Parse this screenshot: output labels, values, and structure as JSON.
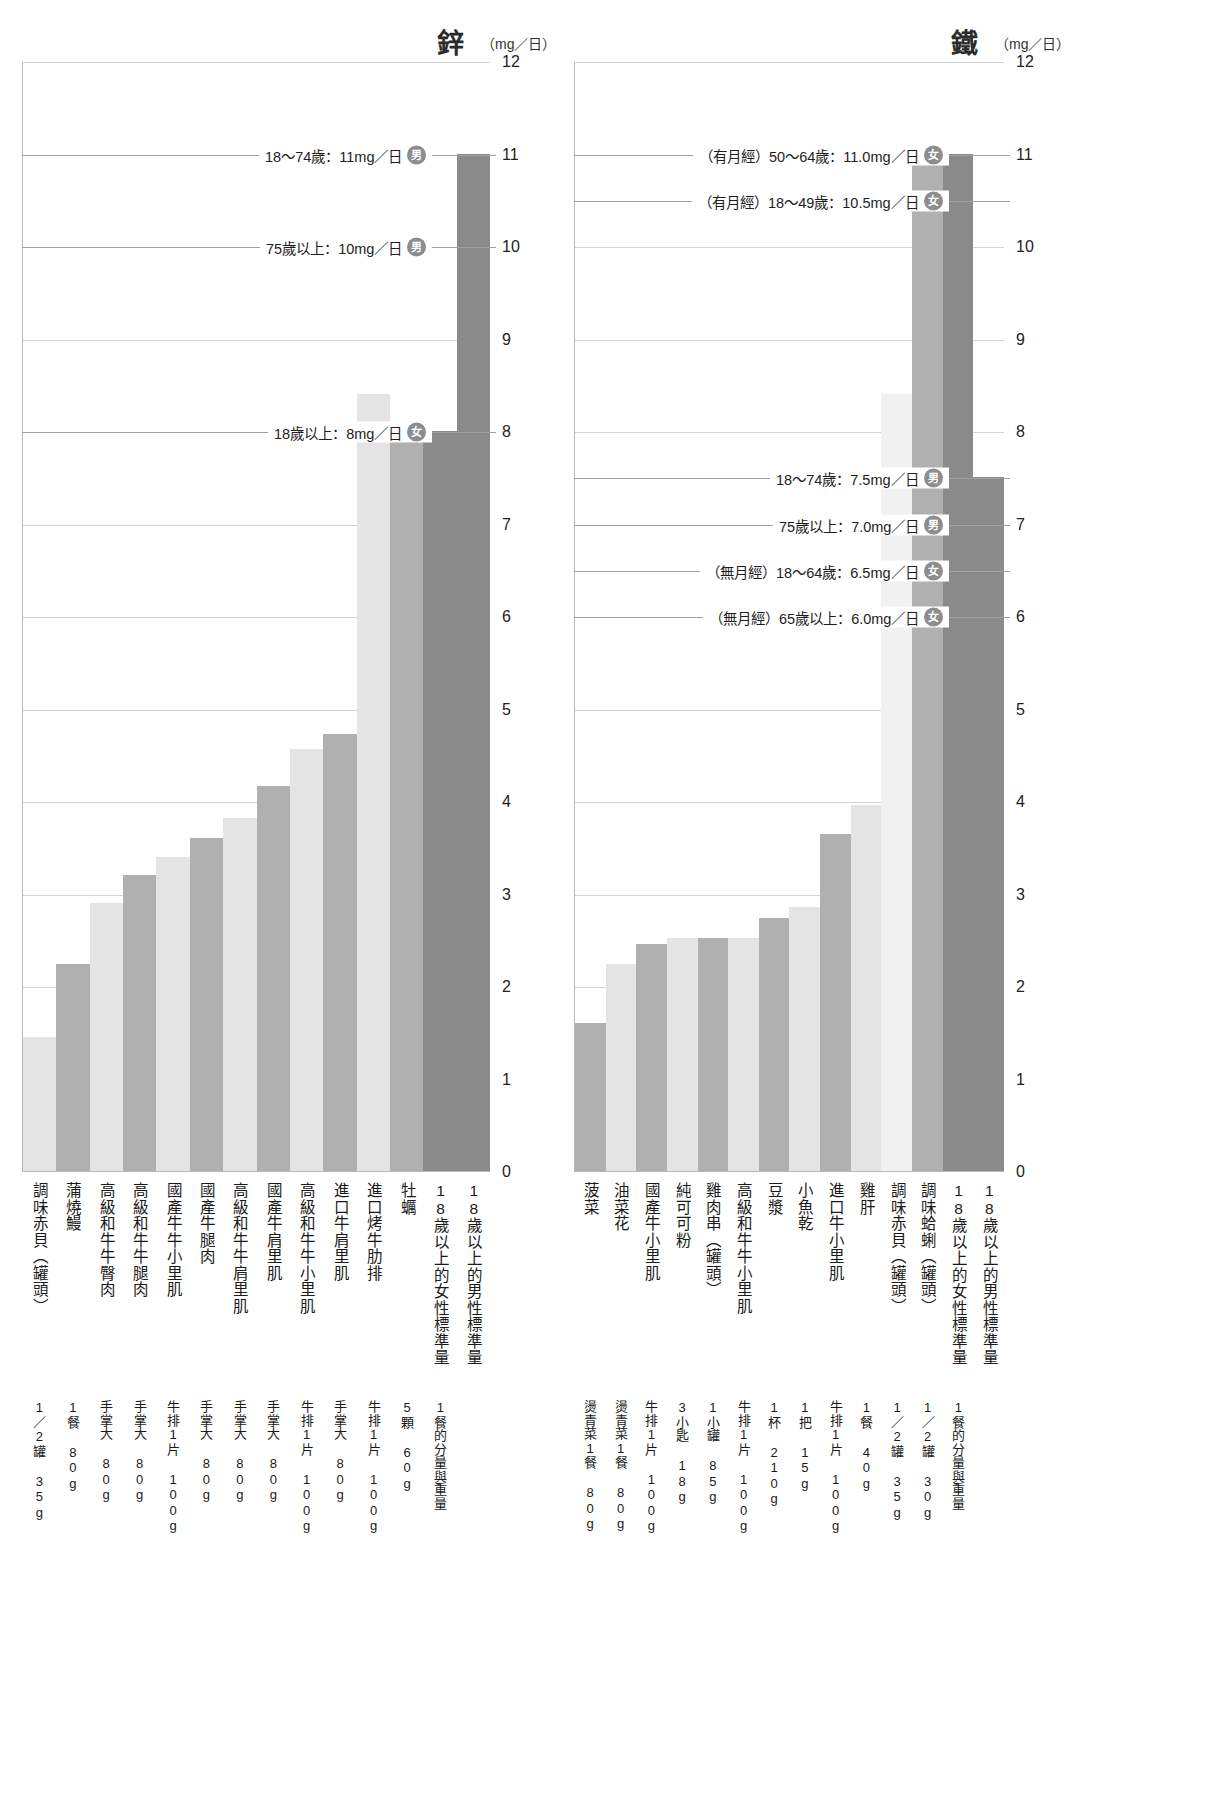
{
  "footnote": "",
  "badges": {
    "male": "男",
    "female": "女"
  },
  "axis": {
    "ticks": [
      "0",
      "1",
      "2",
      "3",
      "4",
      "5",
      "6",
      "7",
      "8",
      "9",
      "10",
      "11",
      "12"
    ],
    "min": 0,
    "max": 12
  },
  "panels": [
    {
      "id": "zinc",
      "title": "鋅",
      "unit": "（mg／日）",
      "references": [
        {
          "label": "18〜74歲：11mg／日",
          "badge": "男",
          "value": 11
        },
        {
          "label": "75歲以上：10mg／日",
          "badge": "男",
          "value": 10
        },
        {
          "label": "18歲以上：8mg／日",
          "badge": "女",
          "value": 8
        }
      ],
      "items": [
        {
          "name": "調味赤貝（罐頭）",
          "value": 1.45,
          "shade": "lt",
          "serving": "1／2罐 35g"
        },
        {
          "name": "蒲燒鰻",
          "value": 2.24,
          "shade": "md",
          "serving": "1餐 80g"
        },
        {
          "name": "高級和牛牛臀肉",
          "value": 2.9,
          "shade": "lt",
          "serving": "手掌大 80g"
        },
        {
          "name": "高級和牛牛腿肉",
          "value": 3.2,
          "shade": "md",
          "serving": "手掌大 80g"
        },
        {
          "name": "國產牛牛小里肌",
          "value": 3.4,
          "shade": "lt",
          "serving": "牛排1片 100g"
        },
        {
          "name": "國產牛腿肉",
          "value": 3.6,
          "shade": "md",
          "serving": "手掌大 80g"
        },
        {
          "name": "高級和牛牛肩里肌",
          "value": 3.82,
          "shade": "lt",
          "serving": "手掌大 80g"
        },
        {
          "name": "國產牛肩里肌",
          "value": 4.16,
          "shade": "md",
          "serving": "手掌大 80g"
        },
        {
          "name": "高級和牛牛小里肌",
          "value": 4.56,
          "shade": "lt",
          "serving": "牛排1片 100g"
        },
        {
          "name": "進口牛肩里肌",
          "value": 4.72,
          "shade": "md",
          "serving": "手掌大 80g"
        },
        {
          "name": "進口烤牛肋排",
          "value": 8.4,
          "shade": "lt",
          "serving": "牛排1片 100g"
        },
        {
          "name": "牡蠣",
          "value": 7.96,
          "shade": "md",
          "serving": "5顆 60g"
        },
        {
          "name": "18歲以上的女性標準量",
          "value": 0,
          "shade": "none",
          "serving": "1餐的分量與重量",
          "is_standard": true
        },
        {
          "name": "18歲以上的男性標準量",
          "value": 0,
          "shade": "none",
          "serving": "",
          "is_standard": true
        }
      ]
    },
    {
      "id": "iron",
      "title": "鐵",
      "unit": "（mg／日）",
      "references": [
        {
          "label": "（有月經）50〜64歲：11.0mg／日",
          "badge": "女",
          "value": 11.0
        },
        {
          "label": "（有月經）18〜49歲：10.5mg／日",
          "badge": "女",
          "value": 10.5
        },
        {
          "label": "18〜74歲：7.5mg／日",
          "badge": "男",
          "value": 7.5
        },
        {
          "label": "75歲以上：7.0mg／日",
          "badge": "男",
          "value": 7.0
        },
        {
          "label": "（無月經）18〜64歲：6.5mg／日",
          "badge": "女",
          "value": 6.5
        },
        {
          "label": "（無月經）65歲以上：6.0mg／日",
          "badge": "女",
          "value": 6.0
        }
      ],
      "items": [
        {
          "name": "菠菜",
          "value": 1.6,
          "shade": "md",
          "serving": "燙青菜1餐 80g"
        },
        {
          "name": "油菜花",
          "value": 2.24,
          "shade": "lt",
          "serving": "燙青菜1餐 80g"
        },
        {
          "name": "國產牛小里肌",
          "value": 2.45,
          "shade": "md",
          "serving": "牛排1片 100g"
        },
        {
          "name": "純可可粉",
          "value": 2.52,
          "shade": "lt",
          "serving": "3小匙 18g"
        },
        {
          "name": "雞肉串（罐頭）",
          "value": 2.52,
          "shade": "md",
          "serving": "1小罐 85g"
        },
        {
          "name": "高級和牛牛小里肌",
          "value": 2.52,
          "shade": "lt",
          "serving": "牛排1片 100g"
        },
        {
          "name": "豆漿",
          "value": 2.73,
          "shade": "md",
          "serving": "1杯 210g"
        },
        {
          "name": "小魚乾",
          "value": 2.85,
          "shade": "lt",
          "serving": "1把 15g"
        },
        {
          "name": "進口牛小里肌",
          "value": 3.64,
          "shade": "md",
          "serving": "牛排1片 100g"
        },
        {
          "name": "雞肝",
          "value": 3.96,
          "shade": "lt",
          "serving": "1餐 40g"
        },
        {
          "name": "調味赤貝（罐頭）",
          "value": 8.4,
          "shade": "vlt",
          "serving": "1／2罐 35g"
        },
        {
          "name": "調味蛤蜊（罐頭）",
          "value": 11.04,
          "shade": "md",
          "serving": "1／2罐 30g"
        },
        {
          "name": "18歲以上的女性標準量",
          "value": 0,
          "shade": "none",
          "serving": "1餐的分量與重量",
          "is_standard": true
        },
        {
          "name": "18歲以上的男性標準量",
          "value": 0,
          "shade": "none",
          "serving": "",
          "is_standard": true
        }
      ]
    }
  ],
  "chart_data": {
    "type": "bar",
    "ylabel": "mg／日",
    "ylim": [
      0,
      12
    ],
    "grid": true,
    "legend": "none",
    "charts": [
      {
        "panel": "鋅",
        "unit": "mg／日",
        "ylim": [
          0,
          12
        ],
        "yticks": [
          0,
          1,
          2,
          3,
          4,
          5,
          6,
          7,
          8,
          9,
          10,
          11,
          12
        ],
        "categories": [
          "調味赤貝（罐頭）",
          "蒲燒鰻",
          "高級和牛牛臀肉",
          "高級和牛牛腿肉",
          "國產牛牛小里肌",
          "國產牛腿肉",
          "高級和牛牛肩里肌",
          "國產牛肩里肌",
          "高級和牛牛小里肌",
          "進口牛肩里肌",
          "進口烤牛肋排",
          "牡蠣",
          "18歲以上的女性標準量",
          "18歲以上的男性標準量"
        ],
        "values": [
          1.45,
          2.24,
          2.9,
          3.2,
          3.4,
          3.6,
          3.82,
          4.16,
          4.56,
          4.72,
          8.4,
          7.96,
          8.0,
          11.0
        ],
        "servings": [
          "1／2罐 35g",
          "1餐 80g",
          "手掌大 80g",
          "手掌大 80g",
          "牛排1片 100g",
          "手掌大 80g",
          "手掌大 80g",
          "手掌大 80g",
          "牛排1片 100g",
          "手掌大 80g",
          "牛排1片 100g",
          "5顆 60g",
          "1餐的分量與重量",
          ""
        ],
        "reference_lines": [
          {
            "label": "18〜74歲：11mg／日",
            "sex": "男",
            "value": 11
          },
          {
            "label": "75歲以上：10mg／日",
            "sex": "男",
            "value": 10
          },
          {
            "label": "18歲以上：8mg／日",
            "sex": "女",
            "value": 8
          }
        ]
      },
      {
        "panel": "鐵",
        "unit": "mg／日",
        "ylim": [
          0,
          12
        ],
        "yticks": [
          0,
          1,
          2,
          3,
          4,
          5,
          6,
          7,
          8,
          9,
          10,
          11,
          12
        ],
        "categories": [
          "菠菜",
          "油菜花",
          "國產牛小里肌",
          "純可可粉",
          "雞肉串（罐頭）",
          "高級和牛牛小里肌",
          "豆漿",
          "小魚乾",
          "進口牛小里肌",
          "雞肝",
          "調味赤貝（罐頭）",
          "調味蛤蜊（罐頭）",
          "18歲以上的女性標準量",
          "18歲以上的男性標準量"
        ],
        "values": [
          1.6,
          2.24,
          2.45,
          2.52,
          2.52,
          2.52,
          2.73,
          2.85,
          3.64,
          3.96,
          8.4,
          11.04,
          11.0,
          7.5
        ],
        "servings": [
          "燙青菜1餐 80g",
          "燙青菜1餐 80g",
          "牛排1片 100g",
          "3小匙 18g",
          "1小罐 85g",
          "牛排1片 100g",
          "1杯 210g",
          "1把 15g",
          "牛排1片 100g",
          "1餐 40g",
          "1／2罐 35g",
          "1／2罐 30g",
          "1餐的分量與重量",
          ""
        ],
        "reference_lines": [
          {
            "label": "（有月經）50〜64歲：11.0mg／日",
            "sex": "女",
            "value": 11.0
          },
          {
            "label": "（有月經）18〜49歲：10.5mg／日",
            "sex": "女",
            "value": 10.5
          },
          {
            "label": "18〜74歲：7.5mg／日",
            "sex": "男",
            "value": 7.5
          },
          {
            "label": "75歲以上：7.0mg／日",
            "sex": "男",
            "value": 7.0
          },
          {
            "label": "（無月經）18〜64歲：6.5mg／日",
            "sex": "女",
            "value": 6.5
          },
          {
            "label": "（無月經）65歲以上：6.0mg／日",
            "sex": "女",
            "value": 6.0
          }
        ]
      }
    ]
  }
}
